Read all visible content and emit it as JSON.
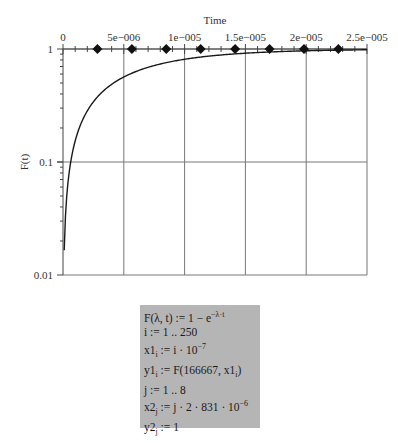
{
  "chart_data": {
    "type": "line",
    "title": "",
    "xlabel": "Time",
    "ylabel": "F(t)",
    "x_axis_position": "top",
    "yscale": "log",
    "xlim": [
      0,
      2.5e-05
    ],
    "ylim": [
      0.01,
      1
    ],
    "grid": true,
    "xticks": [
      0,
      5e-06,
      1e-05,
      1.5e-05,
      2e-05,
      2.5e-05
    ],
    "xtick_labels": [
      "0",
      "5e−006",
      "1e−005",
      "1.5e−005",
      "2e−005",
      "2.5e−005"
    ],
    "yticks": [
      0.01,
      0.1,
      1
    ],
    "ytick_labels": [
      "0.01",
      "0.1",
      "1"
    ],
    "series": [
      {
        "name": "y1 = F(166667, x1)",
        "style": "line",
        "lambda": 166667,
        "x_start": 1e-07,
        "x_step": 1e-07,
        "n_points": 250,
        "formula": "1 - exp(-lambda * t)"
      },
      {
        "name": "y2",
        "style": "diamond-markers",
        "x": [
          2.831e-06,
          5.662e-06,
          8.493e-06,
          1.1324e-05,
          1.4155e-05,
          1.6986e-05,
          1.9817e-05,
          2.2648e-05
        ],
        "y": [
          1,
          1,
          1,
          1,
          1,
          1,
          1,
          1
        ]
      }
    ]
  },
  "formulas": [
    {
      "id": "F",
      "text": "F(λ, t) := 1 − e",
      "sup": "−λ·t"
    },
    {
      "id": "i",
      "text": "i := 1 ..   250",
      "sup": ""
    },
    {
      "id": "x1",
      "text": "x1",
      "sub": "i",
      "rest": " := i · 10",
      "sup": "−7"
    },
    {
      "id": "y1",
      "text": "y1",
      "sub": "i",
      "rest": " := F(166667, x1",
      "sub2": "i",
      "rest2": ")"
    },
    {
      "id": "j",
      "text": "j := 1 ..   8",
      "sup": ""
    },
    {
      "id": "x2",
      "text": "x2",
      "sub": "j",
      "rest": " := j · 2 · 831 · 10",
      "sup": "−6"
    },
    {
      "id": "y2",
      "text": "y2",
      "sub": "j",
      "rest": " := 1"
    }
  ],
  "colors": {
    "curve": "#1a1a1a",
    "grid": "#777777",
    "marker": "#111111",
    "formula_bg": "#b5b5b5"
  }
}
